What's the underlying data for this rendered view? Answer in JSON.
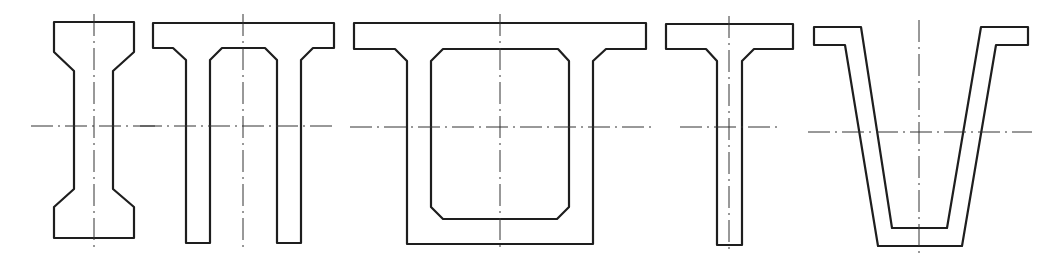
{
  "colors": {
    "outline": "#1e1e1e",
    "centerline": "#333333",
    "background": "#ffffff"
  },
  "sections": [
    {
      "id": "i-section",
      "name": "I-section"
    },
    {
      "id": "double-t-section",
      "name": "Double-T (Pi) section"
    },
    {
      "id": "box-section",
      "name": "Box section"
    },
    {
      "id": "t-section",
      "name": "T-section"
    },
    {
      "id": "trough-section",
      "name": "Trough (V) section"
    }
  ]
}
